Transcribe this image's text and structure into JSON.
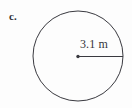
{
  "figure": {
    "part_label": "c.",
    "shape": "circle",
    "background_color": "#fdfdfd",
    "stroke_color": "#3a3a40",
    "text_color": "#34343a",
    "measurement": {
      "label": "3.1 m",
      "value": "3.1",
      "unit": "m",
      "quantity": "radius"
    },
    "geometry": {
      "center_x": "78",
      "center_y": "56",
      "radius_px": "45"
    }
  }
}
